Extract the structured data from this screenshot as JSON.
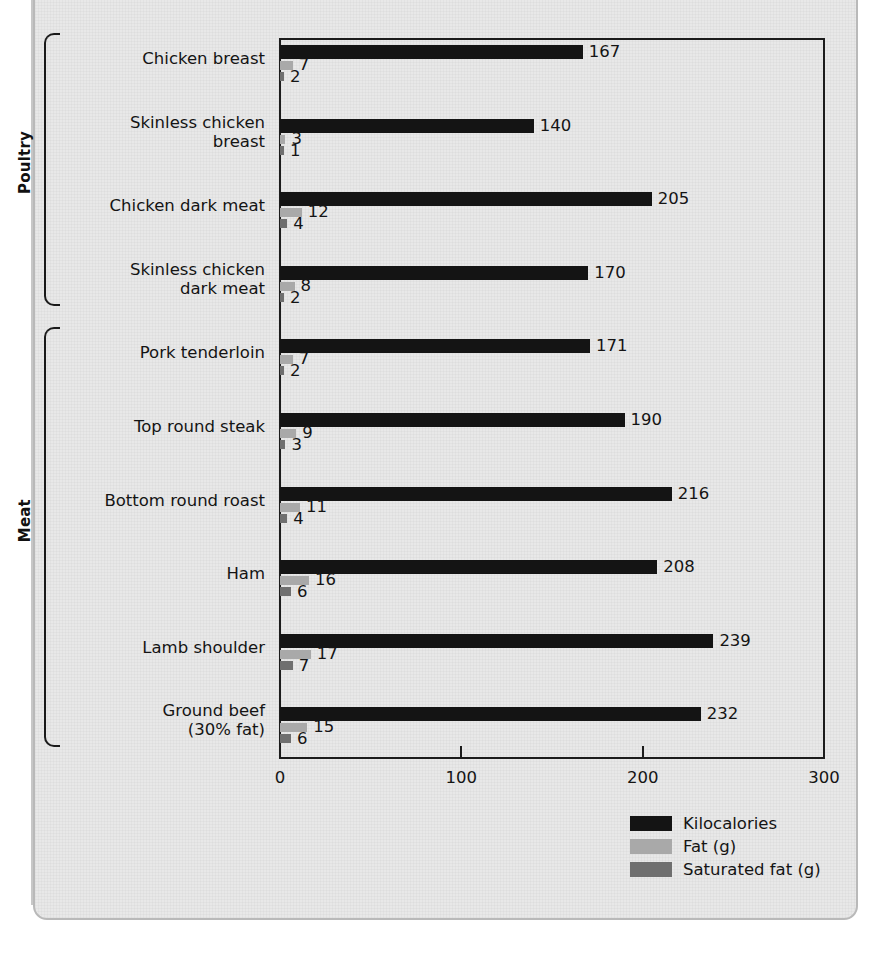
{
  "chart_data": {
    "type": "bar",
    "orientation": "horizontal",
    "title": "",
    "xlabel": "",
    "ylabel": "",
    "xlim": [
      0,
      300
    ],
    "xticks": [
      0,
      100,
      200,
      300
    ],
    "xtick_labels": [
      "0",
      "100",
      "200",
      "300"
    ],
    "grid": false,
    "legend_position": "bottom-right",
    "series": [
      {
        "name": "Kilocalories",
        "color": "#141414",
        "values": [
          167,
          140,
          205,
          170,
          171,
          190,
          216,
          208,
          239,
          232
        ]
      },
      {
        "name": "Fat (g)",
        "color": "#a9a9a9",
        "values": [
          7,
          3,
          12,
          8,
          7,
          9,
          11,
          16,
          17,
          15
        ]
      },
      {
        "name": "Saturated fat (g)",
        "color": "#6f6f6f",
        "values": [
          2,
          1,
          4,
          2,
          2,
          3,
          4,
          6,
          7,
          6
        ]
      }
    ],
    "categories": [
      "Chicken breast",
      "Skinless chicken breast",
      "Chicken dark meat",
      "Skinless chicken dark meat",
      "Pork tenderloin",
      "Top round steak",
      "Bottom round roast",
      "Ham",
      "Lamb shoulder",
      "Ground beef (30% fat)"
    ],
    "category_groups": [
      {
        "label": "Poultry",
        "start": 0,
        "end": 3
      },
      {
        "label": "Meat",
        "start": 4,
        "end": 9
      }
    ]
  },
  "categories": [
    {
      "line1": "Chicken breast",
      "line2": ""
    },
    {
      "line1": "Skinless chicken",
      "line2": "breast"
    },
    {
      "line1": "Chicken dark meat",
      "line2": ""
    },
    {
      "line1": "Skinless chicken",
      "line2": "dark meat"
    },
    {
      "line1": "Pork tenderloin",
      "line2": ""
    },
    {
      "line1": "Top round steak",
      "line2": ""
    },
    {
      "line1": "Bottom round roast",
      "line2": ""
    },
    {
      "line1": "Ham",
      "line2": ""
    },
    {
      "line1": "Lamb shoulder",
      "line2": ""
    },
    {
      "line1": "Ground beef",
      "line2": "(30% fat)"
    }
  ],
  "values": {
    "kcal": [
      "167",
      "140",
      "205",
      "170",
      "171",
      "190",
      "216",
      "208",
      "239",
      "232"
    ],
    "fat": [
      "7",
      "3",
      "12",
      "8",
      "7",
      "9",
      "11",
      "16",
      "17",
      "15"
    ],
    "sat": [
      "2",
      "1",
      "4",
      "2",
      "2",
      "3",
      "4",
      "6",
      "7",
      "6"
    ]
  },
  "groups": [
    {
      "label": "Poultry"
    },
    {
      "label": "Meat"
    }
  ],
  "axis": {
    "ticks": [
      "0",
      "100",
      "200",
      "300"
    ]
  },
  "legend": {
    "items": [
      {
        "label": "Kilocalories",
        "color": "#141414"
      },
      {
        "label": "Fat (g)",
        "color": "#a9a9a9"
      },
      {
        "label": "Saturated fat (g)",
        "color": "#6f6f6f"
      }
    ]
  },
  "colors": {
    "kilocalories": "#141414",
    "fat": "#a9a9a9",
    "saturated_fat": "#6f6f6f",
    "panel_background": "#e8e8e8",
    "axis": "#1c1c1c"
  }
}
